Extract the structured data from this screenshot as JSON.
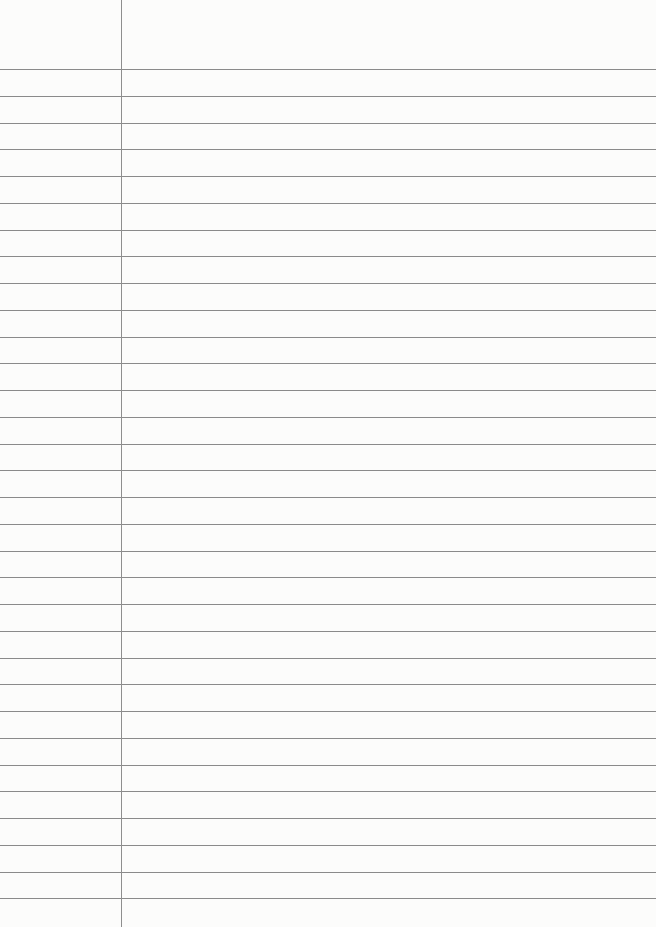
{
  "paper": {
    "type": "lined notebook paper",
    "background_color": "#fcfcfb",
    "rule_color": "#8a8a8a",
    "margin_line_color": "#8e8e8e",
    "margin_line_x": 121,
    "first_rule_y": 69,
    "rule_spacing": 26.75,
    "rule_count": 32
  }
}
